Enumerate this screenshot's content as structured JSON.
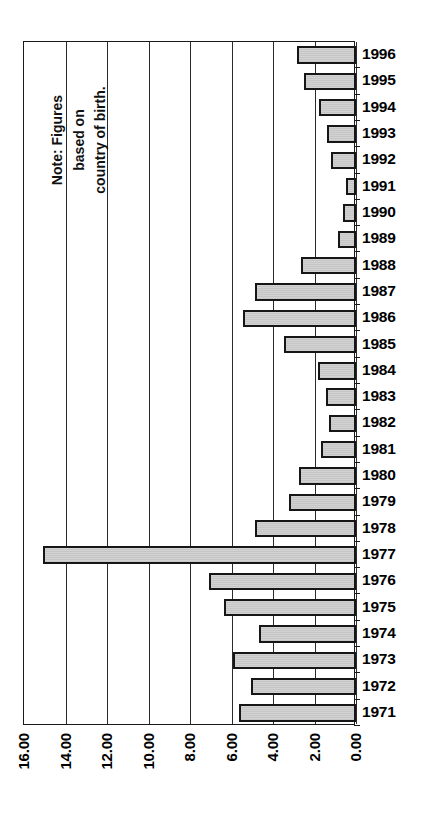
{
  "chart_data": {
    "type": "bar",
    "orientation": "horizontal",
    "title": "",
    "subtitle": "",
    "xlabel": "",
    "ylabel": "",
    "xlim": [
      16.0,
      0.0
    ],
    "axis_reversed": true,
    "grid": true,
    "legend": null,
    "xticks": [
      "16.00",
      "14.00",
      "12.00",
      "10.00",
      "8.00",
      "6.00",
      "4.00",
      "2.00",
      "0.00"
    ],
    "xtick_values": [
      16,
      14,
      12,
      10,
      8,
      6,
      4,
      2,
      0
    ],
    "categories": [
      "1996",
      "1995",
      "1994",
      "1993",
      "1992",
      "1991",
      "1990",
      "1989",
      "1988",
      "1987",
      "1986",
      "1985",
      "1984",
      "1983",
      "1982",
      "1981",
      "1980",
      "1979",
      "1978",
      "1977",
      "1976",
      "1975",
      "1974",
      "1973",
      "1972",
      "1971"
    ],
    "values": [
      2.84,
      2.5,
      1.78,
      1.4,
      1.2,
      0.48,
      0.63,
      0.87,
      2.65,
      4.87,
      5.45,
      3.47,
      1.83,
      1.45,
      1.3,
      1.69,
      2.75,
      3.23,
      4.87,
      15.1,
      7.08,
      6.36,
      4.67,
      5.93,
      5.06,
      5.64
    ],
    "annotations": [
      {
        "name": "note",
        "text": "Note: Figures\nbased on\ncountry of birth.",
        "rotation": -90
      }
    ],
    "colors": {
      "bar_fill": "#cccccc",
      "bar_border": "#161616",
      "axis": "#1a1a1a",
      "grid": "#2b2b2b",
      "text": "#000000",
      "background": "#ffffff"
    }
  }
}
